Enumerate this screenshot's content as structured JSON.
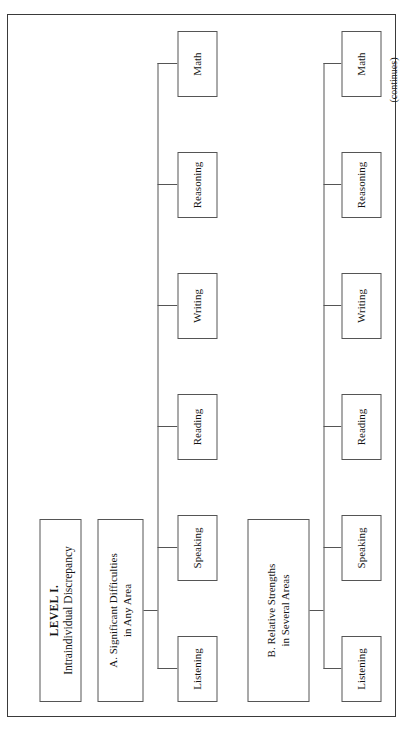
{
  "figure": {
    "orientation": "rotated-90-ccw",
    "page_note": "(continues)",
    "root": {
      "title": "LEVEL I.",
      "subtitle": "Intraindividual Discrepancy"
    },
    "branches": [
      {
        "id": "A",
        "label_line1": "A.  Significant Difficulties",
        "label_line2": "in Any Area",
        "leaves": [
          {
            "label": "Listening"
          },
          {
            "label": "Speaking"
          },
          {
            "label": "Reading"
          },
          {
            "label": "Writing"
          },
          {
            "label": "Reasoning"
          },
          {
            "label": "Math"
          }
        ]
      },
      {
        "id": "B",
        "label_line1": "B.  Relative Strengths",
        "label_line2": "in Several Areas",
        "leaves": [
          {
            "label": "Listening"
          },
          {
            "label": "Speaking"
          },
          {
            "label": "Reading"
          },
          {
            "label": "Writing"
          },
          {
            "label": "Reasoning"
          },
          {
            "label": "Math"
          }
        ]
      }
    ]
  },
  "colors": {
    "page_background": "#ffffff",
    "border": "#3a3a3a",
    "box_border": "#555555",
    "text": "#141414"
  }
}
